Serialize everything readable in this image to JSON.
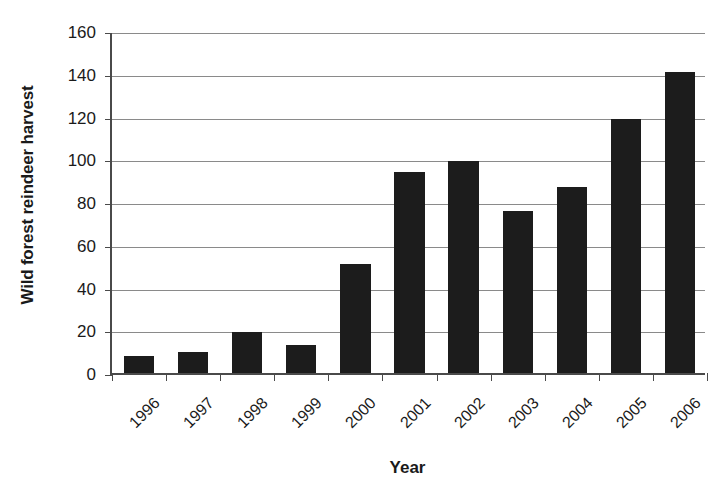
{
  "chart_data": {
    "type": "bar",
    "title": "",
    "xlabel": "Year",
    "ylabel": "Wild forest reindeer harvest",
    "categories": [
      "1996",
      "1997",
      "1998",
      "1999",
      "2000",
      "2001",
      "2002",
      "2003",
      "2004",
      "2005",
      "2006"
    ],
    "values": [
      8,
      10,
      19,
      13,
      51,
      94,
      99,
      76,
      87,
      119,
      141
    ],
    "ylim": [
      0,
      160
    ],
    "ytick_labels": [
      "0",
      "20",
      "40",
      "60",
      "80",
      "100",
      "120",
      "140",
      "160"
    ],
    "ytick_values": [
      0,
      20,
      40,
      60,
      80,
      100,
      120,
      140,
      160
    ],
    "grid": true,
    "legend": false,
    "legend_position": "none",
    "bar_color": "#1c1c1c",
    "gridline_color": "#8a8a8a",
    "axis_color": "#4a4a4a",
    "series": [
      {
        "name": "Wild forest reindeer harvest",
        "values": [
          8,
          10,
          19,
          13,
          51,
          94,
          99,
          76,
          87,
          119,
          141
        ]
      }
    ]
  }
}
